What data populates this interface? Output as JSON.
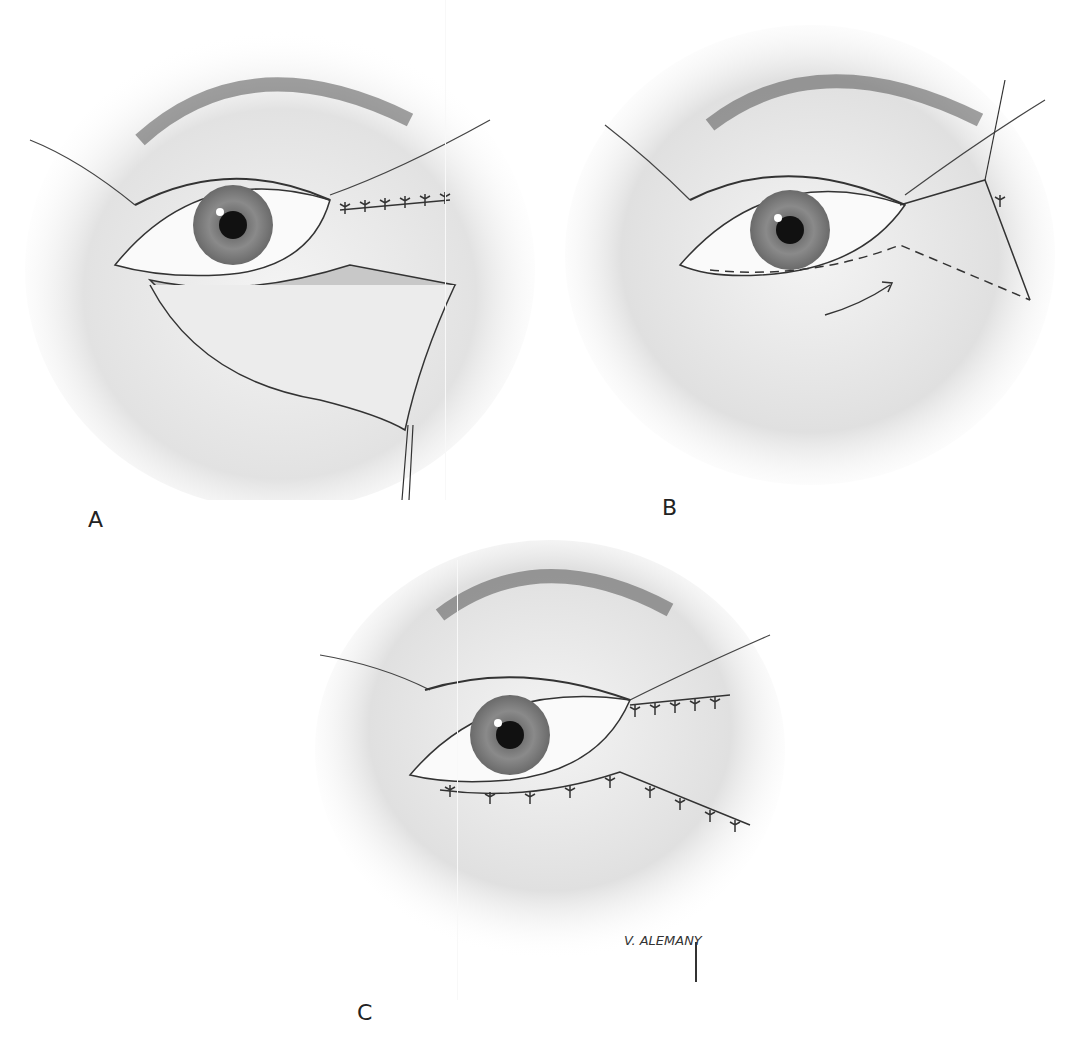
{
  "figure": {
    "panels": [
      {
        "id": "A",
        "label": "A",
        "description": "Lower eyelid skin-muscle flap elevated, exposing orbicularis; upper lateral incision sutured"
      },
      {
        "id": "B",
        "label": "B",
        "description": "Flap redraped with dashed line showing excision outline and arrow indicating direction of advancement"
      },
      {
        "id": "C",
        "label": "C",
        "description": "Final closure with sutures along upper and lower eyelid incisions"
      }
    ],
    "signature": "V. ALEMANY"
  }
}
